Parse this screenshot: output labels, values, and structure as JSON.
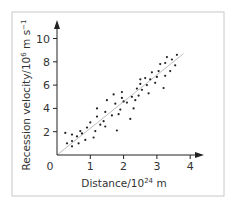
{
  "chart_data": {
    "type": "scatter",
    "title": "",
    "xlabel": "Distance/10^24 m",
    "ylabel": "Recession velocity/10^6 m s^-1",
    "xlim": [
      0,
      4.3
    ],
    "ylim": [
      0,
      10.8
    ],
    "xticks": [
      0,
      1,
      2,
      3,
      4
    ],
    "yticks": [
      2,
      4,
      6,
      8,
      10
    ],
    "grid": false,
    "legend": null,
    "series": [
      {
        "name": "galaxies",
        "points": [
          [
            0.25,
            1.9
          ],
          [
            0.3,
            1.0
          ],
          [
            0.45,
            1.75
          ],
          [
            0.45,
            1.2
          ],
          [
            0.45,
            0.75
          ],
          [
            0.6,
            1.6
          ],
          [
            0.65,
            1.0
          ],
          [
            0.7,
            2.05
          ],
          [
            0.75,
            1.85
          ],
          [
            0.85,
            1.3
          ],
          [
            0.9,
            2.35
          ],
          [
            1.0,
            2.8
          ],
          [
            1.1,
            1.5
          ],
          [
            1.15,
            2.05
          ],
          [
            1.2,
            4.0
          ],
          [
            1.2,
            3.3
          ],
          [
            1.3,
            2.6
          ],
          [
            1.4,
            2.9
          ],
          [
            1.45,
            2.45
          ],
          [
            1.45,
            3.7
          ],
          [
            1.5,
            4.7
          ],
          [
            1.65,
            3.4
          ],
          [
            1.7,
            5.2
          ],
          [
            1.75,
            4.4
          ],
          [
            1.8,
            2.1
          ],
          [
            1.85,
            3.5
          ],
          [
            1.9,
            3.9
          ],
          [
            1.95,
            5.4
          ],
          [
            1.95,
            4.9
          ],
          [
            2.0,
            4.6
          ],
          [
            2.1,
            4.5
          ],
          [
            2.2,
            3.1
          ],
          [
            2.25,
            5.0
          ],
          [
            2.3,
            4.0
          ],
          [
            2.35,
            4.7
          ],
          [
            2.4,
            5.7
          ],
          [
            2.45,
            5.1
          ],
          [
            2.5,
            6.1
          ],
          [
            2.5,
            6.5
          ],
          [
            2.55,
            5.6
          ],
          [
            2.65,
            6.6
          ],
          [
            2.7,
            6.0
          ],
          [
            2.75,
            5.3
          ],
          [
            2.8,
            6.5
          ],
          [
            2.85,
            7.1
          ],
          [
            2.95,
            6.2
          ],
          [
            3.0,
            6.7
          ],
          [
            3.05,
            7.2
          ],
          [
            3.1,
            7.8
          ],
          [
            3.2,
            5.75
          ],
          [
            3.25,
            7.9
          ],
          [
            3.25,
            6.8
          ],
          [
            3.3,
            8.4
          ],
          [
            3.4,
            7.2
          ],
          [
            3.45,
            8.2
          ],
          [
            3.55,
            7.7
          ],
          [
            3.6,
            8.6
          ]
        ]
      }
    ],
    "fit_line": {
      "x": [
        0,
        3.8
      ],
      "y": [
        0,
        8.7
      ]
    }
  },
  "axes": {
    "origin_label": "0",
    "x_ticks": [
      "1",
      "2",
      "3",
      "4"
    ],
    "y_ticks": [
      "2",
      "4",
      "6",
      "8",
      "10"
    ],
    "xlabel_main": "Distance/10",
    "xlabel_exp": "24",
    "xlabel_unit": " m",
    "ylabel_main": "Recession velocity/10",
    "ylabel_exp": "6",
    "ylabel_unit": " m s",
    "ylabel_exp2": "−1"
  }
}
